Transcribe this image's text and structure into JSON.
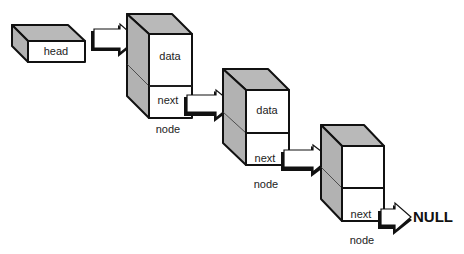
{
  "diagram": {
    "head": {
      "label": "head"
    },
    "nodes": [
      {
        "data_label": "data",
        "next_label": "next",
        "caption": "node"
      },
      {
        "data_label": "data",
        "next_label": "next",
        "caption": "node"
      },
      {
        "data_label": "",
        "next_label": "next",
        "caption": "node"
      }
    ],
    "terminator": {
      "label": "NULL"
    },
    "colors": {
      "face": "#ffffff",
      "shade": "#b9b9b9",
      "outline": "#111111"
    }
  }
}
